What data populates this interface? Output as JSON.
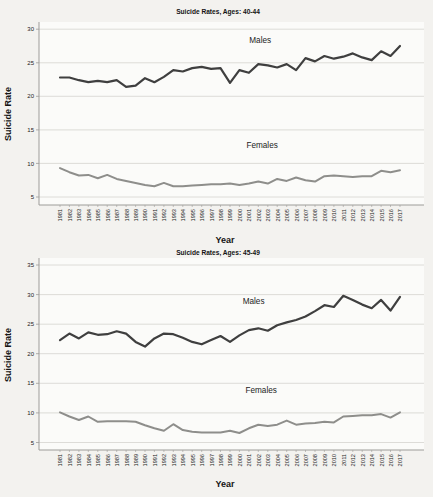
{
  "page": {
    "background": "#f3f2ef",
    "plot_background": "#fbfbf9"
  },
  "colors": {
    "males_line": "#3f3f3f",
    "females_line": "#8e8e8b",
    "gridline": "#d9d8d4",
    "axis": "#9d9c99",
    "text": "#1c1c1c"
  },
  "chart_data": [
    {
      "type": "line",
      "title": "Suicide Rates, Ages: 40-44",
      "xlabel": "Year",
      "ylabel": "Suicide Rate",
      "grid": true,
      "legend": "in-plot series labels",
      "x": [
        1981,
        1982,
        1983,
        1984,
        1985,
        1986,
        1987,
        1988,
        1989,
        1990,
        1991,
        1992,
        1993,
        1994,
        1995,
        1996,
        1997,
        1998,
        1999,
        2000,
        2001,
        2002,
        2003,
        2004,
        2005,
        2006,
        2007,
        2008,
        2009,
        2010,
        2011,
        2012,
        2013,
        2014,
        2015,
        2016,
        2017
      ],
      "yticks": [
        5,
        10,
        15,
        20,
        25,
        30
      ],
      "ylim": [
        3.8,
        31.1
      ],
      "series": [
        {
          "name": "Males",
          "color": "#3f3f3f",
          "label_pos": {
            "year": 2002.2,
            "value": 27.9
          },
          "values": [
            22.8,
            22.8,
            22.4,
            22.1,
            22.3,
            22.1,
            22.4,
            21.4,
            21.6,
            22.7,
            22.1,
            22.9,
            23.9,
            23.7,
            24.2,
            24.4,
            24.1,
            24.2,
            22.0,
            23.9,
            23.5,
            24.8,
            24.6,
            24.3,
            24.8,
            23.9,
            25.7,
            25.2,
            26.0,
            25.6,
            25.9,
            26.4,
            25.8,
            25.4,
            26.7,
            26.0,
            27.5
          ]
        },
        {
          "name": "Females",
          "color": "#8e8e8b",
          "label_pos": {
            "year": 2002.4,
            "value": 12.3
          },
          "values": [
            9.3,
            8.7,
            8.2,
            8.3,
            7.8,
            8.3,
            7.7,
            7.4,
            7.1,
            6.8,
            6.6,
            7.1,
            6.6,
            6.6,
            6.7,
            6.8,
            6.9,
            6.9,
            7.0,
            6.8,
            7.0,
            7.3,
            7.0,
            7.7,
            7.4,
            7.9,
            7.5,
            7.3,
            8.1,
            8.2,
            8.1,
            8.0,
            8.1,
            8.1,
            8.9,
            8.7,
            9.0
          ]
        }
      ]
    },
    {
      "type": "line",
      "title": "Suicide Rates, Ages: 45-49",
      "xlabel": "Year",
      "ylabel": "Suicide Rate",
      "grid": true,
      "legend": "in-plot series labels",
      "x": [
        1981,
        1982,
        1983,
        1984,
        1985,
        1986,
        1987,
        1988,
        1989,
        1990,
        1991,
        1992,
        1993,
        1994,
        1995,
        1996,
        1997,
        1998,
        1999,
        2000,
        2001,
        2002,
        2003,
        2004,
        2005,
        2006,
        2007,
        2008,
        2009,
        2010,
        2011,
        2012,
        2013,
        2014,
        2015,
        2016,
        2017
      ],
      "yticks": [
        5,
        10,
        15,
        20,
        25,
        30,
        35
      ],
      "ylim": [
        3.7,
        36.2
      ],
      "series": [
        {
          "name": "Males",
          "color": "#3f3f3f",
          "label_pos": {
            "year": 2001.5,
            "value": 28.4
          },
          "values": [
            22.3,
            23.4,
            22.6,
            23.6,
            23.2,
            23.3,
            23.8,
            23.4,
            22.0,
            21.2,
            22.6,
            23.4,
            23.3,
            22.7,
            22.0,
            21.6,
            22.3,
            23.0,
            22.0,
            23.1,
            24.0,
            24.3,
            23.9,
            24.8,
            25.3,
            25.7,
            26.3,
            27.2,
            28.2,
            27.9,
            29.8,
            29.1,
            28.3,
            27.7,
            29.1,
            27.3,
            29.6
          ]
        },
        {
          "name": "Females",
          "color": "#8e8e8b",
          "label_pos": {
            "year": 2002.3,
            "value": 13.4
          },
          "values": [
            10.1,
            9.4,
            8.8,
            9.4,
            8.5,
            8.6,
            8.6,
            8.6,
            8.5,
            7.9,
            7.4,
            7.0,
            8.1,
            7.1,
            6.8,
            6.7,
            6.7,
            6.7,
            7.0,
            6.6,
            7.4,
            8.0,
            7.8,
            8.0,
            8.7,
            8.0,
            8.2,
            8.3,
            8.5,
            8.4,
            9.4,
            9.5,
            9.6,
            9.6,
            9.8,
            9.2,
            10.1
          ]
        }
      ]
    }
  ]
}
